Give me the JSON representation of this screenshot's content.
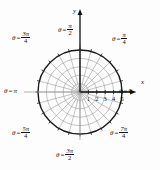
{
  "figure": {
    "background_color": "#fdfdfd",
    "ink_color": "#111111",
    "grid_color": "#9a9a9a",
    "outer_circle_color": "#1a1a1a"
  },
  "axes": {
    "x_label": "x",
    "y_label": "y"
  },
  "angle_labels": [
    {
      "key": "pi_over_2",
      "theta": "θ",
      "eq": "=",
      "num": "π",
      "den": "2",
      "simple": null,
      "degrees": 90
    },
    {
      "key": "pi_over_4",
      "theta": "θ",
      "eq": "=",
      "num": "π",
      "den": "4",
      "simple": null,
      "degrees": 45
    },
    {
      "key": "three_pi_4",
      "theta": "θ",
      "eq": "=",
      "num": "3π",
      "den": "4",
      "simple": null,
      "degrees": 135
    },
    {
      "key": "pi",
      "theta": "θ",
      "eq": "=",
      "num": null,
      "den": null,
      "simple": "π",
      "degrees": 180
    },
    {
      "key": "zero",
      "theta": "θ",
      "eq": "=",
      "num": null,
      "den": null,
      "simple": "0",
      "degrees": 0
    },
    {
      "key": "five_pi_4",
      "theta": "θ",
      "eq": "=",
      "num": "5π",
      "den": "4",
      "simple": null,
      "degrees": 225
    },
    {
      "key": "seven_pi_4",
      "theta": "θ",
      "eq": "=",
      "num": "7π",
      "den": "4",
      "simple": null,
      "degrees": 315
    },
    {
      "key": "three_pi_2",
      "theta": "θ",
      "eq": "=",
      "num": "3π",
      "den": "2",
      "simple": null,
      "degrees": 270
    }
  ],
  "radial_ticks": {
    "values": [
      1,
      2,
      3,
      4,
      5
    ],
    "labels": [
      "1",
      "2",
      "3",
      "4",
      "5"
    ]
  },
  "chart_data": {
    "type": "polar-grid",
    "center": {
      "x": 80,
      "y": 92
    },
    "max_radius_units": 5,
    "max_radius_px": 42,
    "circle_count": 5,
    "radial_spoke_count": 24,
    "spoke_step_degrees": 15,
    "r_tick_values": [
      1,
      2,
      3,
      4,
      5
    ],
    "r_tick_labels": [
      "1",
      "2",
      "3",
      "4",
      "5"
    ],
    "angle_tick_labels": [
      "θ = 0",
      "θ = π/4",
      "θ = π/2",
      "θ = 3π/4",
      "θ = π",
      "θ = 5π/4",
      "θ = 3π/2",
      "θ = 7π/4"
    ],
    "angle_tick_degrees": [
      0,
      45,
      90,
      135,
      180,
      225,
      270,
      315
    ],
    "axis_labels": {
      "x": "x",
      "y": "y"
    },
    "grid": true,
    "legend": "none",
    "xlim": [
      -5,
      5
    ],
    "ylim": [
      -5,
      5
    ]
  }
}
